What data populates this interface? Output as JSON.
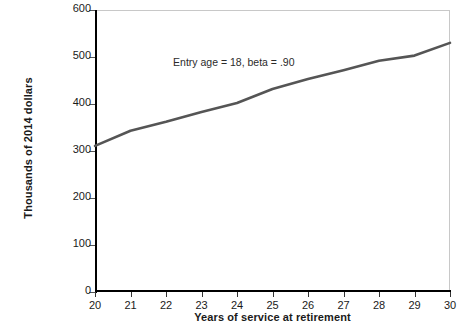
{
  "chart_data": {
    "type": "line",
    "title": "",
    "subtitle": "",
    "xlabel": "Years of service at retirement",
    "ylabel": "Thousands of 2014 dollars",
    "xlim": [
      20,
      30
    ],
    "ylim": [
      0,
      600
    ],
    "xticks": [
      20,
      21,
      22,
      23,
      24,
      25,
      26,
      27,
      28,
      29,
      30
    ],
    "xtick_labels": [
      "20",
      "21",
      "22",
      "23",
      "24",
      "25",
      "26",
      "27",
      "28",
      "29",
      "30"
    ],
    "yticks": [
      0,
      100,
      200,
      300,
      400,
      500,
      600
    ],
    "ytick_labels": [
      "0",
      "100",
      "200",
      "300",
      "400",
      "500",
      "600"
    ],
    "grid": false,
    "legend": false,
    "legend_position": "none",
    "line_color": "#555555",
    "line_width": 2.6,
    "annotations": [
      {
        "text": "Entry age  = 18, beta = .90",
        "x": 22.2,
        "y": 487
      }
    ],
    "x": [
      20,
      21,
      22,
      23,
      24,
      25,
      26,
      27,
      28,
      29,
      30
    ],
    "values": [
      311,
      343,
      362,
      383,
      402,
      432,
      453,
      472,
      492,
      503,
      530
    ],
    "series": [
      {
        "name": "Expected benefit",
        "x": [
          20,
          21,
          22,
          23,
          24,
          25,
          26,
          27,
          28,
          29,
          30
        ],
        "values": [
          311,
          343,
          362,
          383,
          402,
          432,
          453,
          472,
          492,
          503,
          530
        ]
      }
    ]
  },
  "axes": {
    "y_title": "Thousands of 2014 dollars",
    "x_title": "Years of service at retirement"
  }
}
